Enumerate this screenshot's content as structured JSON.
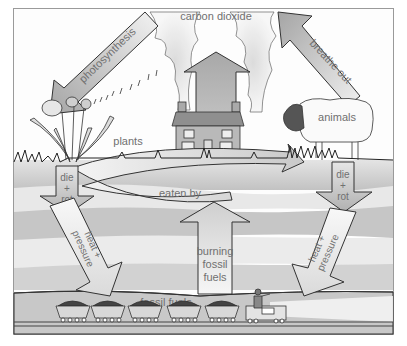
{
  "labels": {
    "carbon_dioxide": "carbon dioxide",
    "photosynthesis": "photosynthesis",
    "breathe_out": "breathe out",
    "plants": "plants",
    "animals": "animals",
    "eaten_by": "eaten by",
    "die_rot_left": {
      "line1": "die",
      "line2": "+",
      "line3": "rot"
    },
    "die_rot_right": {
      "line1": "die",
      "line2": "+",
      "line3": "rot"
    },
    "heat_pressure_left": {
      "line1": "heat +",
      "line2": "pressure"
    },
    "heat_pressure_right": {
      "line1": "heat +",
      "line2": "pressure"
    },
    "burning_fossil_fuels": {
      "line1": "burning",
      "line2": "fossil",
      "line3": "fuels"
    },
    "fossil_fuels": "fossil fuels"
  },
  "nodes": [
    {
      "id": "carbon-dioxide",
      "label": "carbon dioxide"
    },
    {
      "id": "plants",
      "label": "plants"
    },
    {
      "id": "animals",
      "label": "animals"
    },
    {
      "id": "fossil-fuels",
      "label": "fossil fuels"
    }
  ],
  "edges": [
    {
      "from": "carbon-dioxide",
      "to": "plants",
      "label": "photosynthesis"
    },
    {
      "from": "animals",
      "to": "carbon-dioxide",
      "label": "breathe out"
    },
    {
      "from": "plants",
      "to": "animals",
      "label": "eaten by"
    },
    {
      "from": "plants",
      "to": "fossil-fuels",
      "label": "die + rot, heat + pressure"
    },
    {
      "from": "animals",
      "to": "fossil-fuels",
      "label": "die + rot, heat + pressure"
    },
    {
      "from": "fossil-fuels",
      "to": "carbon-dioxide",
      "label": "burning fossil fuels"
    }
  ],
  "colors": {
    "arrow_dark": "#a8a8a8",
    "arrow_light": "#ececec",
    "outline": "#222222",
    "label_text": "#707070",
    "band_dark": "#bdbdbd",
    "band_mid": "#d3d3d3",
    "band_light": "#e9e9e9",
    "underground": "#c4c4c4"
  },
  "train": {
    "wagons": 5
  }
}
